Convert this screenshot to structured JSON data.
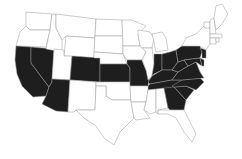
{
  "map": {
    "title": "",
    "region": "United States (contiguous)",
    "highlight_color": "#1e1e1e",
    "base_color": "#ffffff",
    "border_color": "#9a9a9a",
    "highlighted_states": [
      "California",
      "Nevada",
      "Arizona",
      "Colorado",
      "Kansas",
      "Missouri",
      "Indiana",
      "Ohio",
      "Pennsylvania",
      "Kentucky",
      "West Virginia",
      "Virginia",
      "Maryland",
      "Delaware",
      "New Jersey",
      "Tennessee",
      "North Carolina",
      "South Carolina",
      "Georgia"
    ]
  }
}
